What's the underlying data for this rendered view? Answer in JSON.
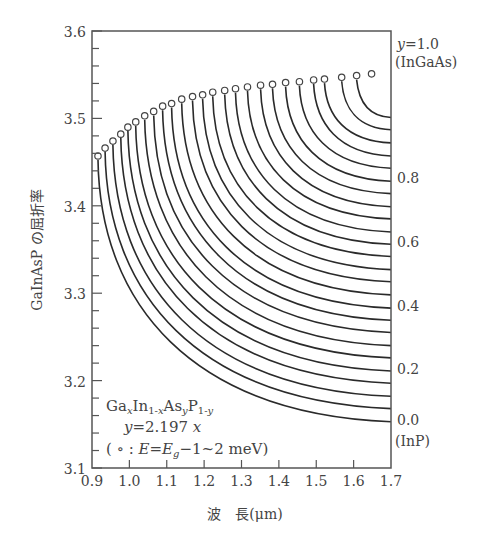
{
  "chart_data": {
    "type": "line",
    "title": "",
    "xlabel": "波　長(μm)",
    "ylabel": "GaInAsP の屈折率",
    "xlim": [
      0.9,
      1.7
    ],
    "ylim": [
      3.1,
      3.6
    ],
    "xticks": [
      "0.9",
      "1.0",
      "1.1",
      "1.2",
      "1.3",
      "1.4",
      "1.5",
      "1.6",
      "1.7"
    ],
    "yticks": [
      "3.1",
      "3.2",
      "3.3",
      "3.4",
      "3.5",
      "3.6"
    ],
    "y_minor_step": 0.02,
    "grid": false,
    "legend": null,
    "right_labels": [
      {
        "text": "y=1.0",
        "n": 3.6
      },
      {
        "text": "(InGaAs)",
        "n": 3.6
      },
      {
        "text": "0.8",
        "n": 3.43
      },
      {
        "text": "0.6",
        "n": 3.356
      },
      {
        "text": "0.4",
        "n": 3.283
      },
      {
        "text": "0.2",
        "n": 3.211
      },
      {
        "text": "0.0",
        "n": 3.153
      },
      {
        "text": "(InP)",
        "n": 3.153
      }
    ],
    "annotation": {
      "line1": "GaₓIn₁₋ₓAsᵧP₁₋ᵧ",
      "line2": "y=2.197x",
      "line3": "( ∘ : E=E_g−1~2 meV)"
    },
    "band_edge_points": {
      "description": "Open circles: refractive index at E = Eg - 1~2 meV for each composition y",
      "y_composition": [
        0.0,
        0.04,
        0.08,
        0.12,
        0.16,
        0.2,
        0.24,
        0.28,
        0.32,
        0.36,
        0.4,
        0.44,
        0.48,
        0.52,
        0.56,
        0.6,
        0.64,
        0.68,
        0.72,
        0.76,
        0.8,
        0.84,
        0.88,
        0.92,
        0.96,
        1.0
      ],
      "wavelength_um": [
        0.916,
        0.935,
        0.956,
        0.977,
        0.996,
        1.017,
        1.041,
        1.065,
        1.089,
        1.113,
        1.14,
        1.169,
        1.196,
        1.223,
        1.255,
        1.284,
        1.316,
        1.351,
        1.383,
        1.418,
        1.455,
        1.493,
        1.522,
        1.568,
        1.608,
        1.648
      ],
      "refractive_index": [
        3.457,
        3.466,
        3.474,
        3.482,
        3.49,
        3.496,
        3.503,
        3.508,
        3.514,
        3.517,
        3.522,
        3.525,
        3.527,
        3.53,
        3.532,
        3.534,
        3.536,
        3.538,
        3.539,
        3.541,
        3.542,
        3.544,
        3.545,
        3.547,
        3.549,
        3.551
      ]
    },
    "series": [
      {
        "name": "y=0.00",
        "end_n": 3.153
      },
      {
        "name": "y=0.04",
        "end_n": 3.168
      },
      {
        "name": "y=0.08",
        "end_n": 3.182
      },
      {
        "name": "y=0.12",
        "end_n": 3.197
      },
      {
        "name": "y=0.16",
        "end_n": 3.211
      },
      {
        "name": "y=0.20",
        "end_n": 3.226
      },
      {
        "name": "y=0.24",
        "end_n": 3.24
      },
      {
        "name": "y=0.28",
        "end_n": 3.255
      },
      {
        "name": "y=0.32",
        "end_n": 3.269
      },
      {
        "name": "y=0.36",
        "end_n": 3.283
      },
      {
        "name": "y=0.40",
        "end_n": 3.298
      },
      {
        "name": "y=0.44",
        "end_n": 3.313
      },
      {
        "name": "y=0.48",
        "end_n": 3.327
      },
      {
        "name": "y=0.52",
        "end_n": 3.342
      },
      {
        "name": "y=0.56",
        "end_n": 3.356
      },
      {
        "name": "y=0.60",
        "end_n": 3.37
      },
      {
        "name": "y=0.64",
        "end_n": 3.385
      },
      {
        "name": "y=0.68",
        "end_n": 3.399
      },
      {
        "name": "y=0.72",
        "end_n": 3.414
      },
      {
        "name": "y=0.76",
        "end_n": 3.428
      },
      {
        "name": "y=0.80",
        "end_n": 3.443
      },
      {
        "name": "y=0.84",
        "end_n": 3.457
      },
      {
        "name": "y=0.88",
        "end_n": 3.472
      },
      {
        "name": "y=0.92",
        "end_n": 3.487
      },
      {
        "name": "y=0.96",
        "end_n": 3.501
      }
    ],
    "colors": {
      "line": "#2a2a2a",
      "axis": "#555555",
      "text": "#444444",
      "marker_fill": "#ffffff"
    }
  }
}
